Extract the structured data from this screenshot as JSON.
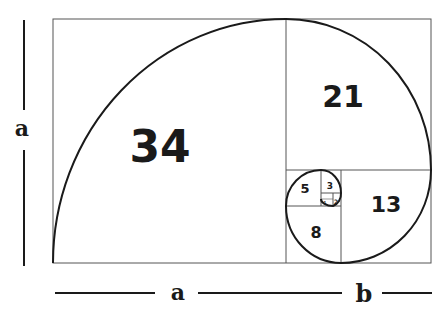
{
  "diagram": {
    "squares": [
      {
        "label": "34"
      },
      {
        "label": "21"
      },
      {
        "label": "13"
      },
      {
        "label": "8"
      },
      {
        "label": "5"
      },
      {
        "label": "3"
      },
      {
        "label": "2"
      },
      {
        "label": "1"
      },
      {
        "label": "1"
      }
    ],
    "dimensions": {
      "left_label": "a",
      "bottom_left_label": "a",
      "bottom_right_label": "b"
    },
    "colors": {
      "line": "#1a1a1a",
      "background": "#ffffff"
    }
  }
}
